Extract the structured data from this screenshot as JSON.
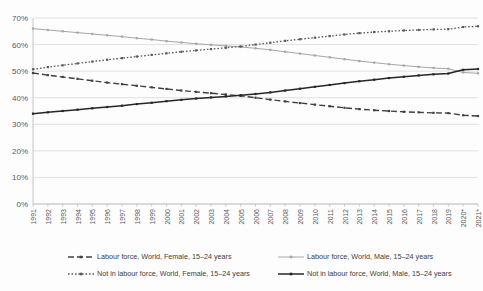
{
  "chart_data": {
    "type": "line",
    "title": "",
    "xlabel": "",
    "ylabel": "",
    "ylim": [
      0,
      0.7
    ],
    "grid": true,
    "legend_position": "bottom",
    "y_tick_labels": [
      "0%",
      "10%",
      "20%",
      "30%",
      "40%",
      "50%",
      "60%",
      "70%"
    ],
    "y_tick_values": [
      0,
      10,
      20,
      30,
      40,
      50,
      60,
      70
    ],
    "categories": [
      "1991",
      "1992",
      "1993",
      "1994",
      "1995",
      "1996",
      "1997",
      "1998",
      "1999",
      "2000",
      "2001",
      "2002",
      "2003",
      "2004",
      "2005",
      "2006",
      "2007",
      "2008",
      "2009",
      "2010",
      "2011",
      "2012",
      "2013",
      "2014",
      "2015",
      "2016",
      "2017",
      "2018",
      "2019",
      "2020*",
      "2021*"
    ],
    "series": [
      {
        "name": "Labour force, World, Female, 15–24 years",
        "style": "dashed",
        "color": "#404040",
        "values": [
          49.3,
          48.5,
          47.8,
          47.1,
          46.4,
          45.7,
          45.1,
          44.5,
          43.9,
          43.3,
          42.7,
          42.2,
          41.7,
          41.2,
          40.7,
          40.0,
          39.3,
          38.6,
          38.0,
          37.4,
          36.8,
          36.2,
          35.7,
          35.3,
          35.0,
          34.7,
          34.5,
          34.3,
          34.2,
          33.4,
          33.1
        ]
      },
      {
        "name": "Labour force, World, Male, 15–24 years",
        "style": "solid-light",
        "color": "#a6a6a6",
        "values": [
          66.0,
          65.5,
          65.0,
          64.5,
          64.0,
          63.5,
          63.0,
          62.4,
          61.9,
          61.3,
          60.8,
          60.3,
          59.9,
          59.5,
          59.1,
          58.6,
          58.0,
          57.3,
          56.6,
          55.9,
          55.2,
          54.5,
          53.8,
          53.2,
          52.6,
          52.1,
          51.6,
          51.2,
          50.9,
          49.5,
          49.2
        ]
      },
      {
        "name": "Not in labour force, World, Female, 15–24 years",
        "style": "dotted",
        "color": "#595959",
        "values": [
          50.7,
          51.5,
          52.2,
          52.9,
          53.6,
          54.3,
          54.9,
          55.5,
          56.1,
          56.7,
          57.3,
          57.8,
          58.3,
          58.8,
          59.3,
          60.0,
          60.7,
          61.4,
          62.0,
          62.6,
          63.2,
          63.8,
          64.3,
          64.7,
          65.0,
          65.3,
          65.5,
          65.7,
          65.8,
          66.6,
          66.9
        ]
      },
      {
        "name": "Not in labour force, World, Male, 15–24 years",
        "style": "solid-dark",
        "color": "#262626",
        "values": [
          34.0,
          34.5,
          35.0,
          35.5,
          36.0,
          36.5,
          37.0,
          37.6,
          38.1,
          38.7,
          39.2,
          39.7,
          40.1,
          40.5,
          40.9,
          41.4,
          42.0,
          42.7,
          43.4,
          44.1,
          44.8,
          45.5,
          46.2,
          46.8,
          47.4,
          47.9,
          48.4,
          48.8,
          49.1,
          50.5,
          50.8
        ]
      }
    ],
    "legend": [
      {
        "label": "Labour force, World, Female, 15–24 years",
        "style": "dashed",
        "color": "#404040"
      },
      {
        "label": "Labour force, World, Male, 15–24 years",
        "style": "solid-light",
        "color": "#a6a6a6"
      },
      {
        "label": "Not in labour force, World, Female, 15–24 years",
        "style": "dotted",
        "color": "#595959"
      },
      {
        "label": "Not in labour force, World, Male, 15–24 years",
        "style": "solid-dark",
        "color": "#262626"
      }
    ]
  },
  "colors": {
    "gridline": "#d9d9d9",
    "axis": "#bfbfbf",
    "background": "#fdfdfd",
    "tick_text": "#595959",
    "legend_text": "#404040"
  }
}
